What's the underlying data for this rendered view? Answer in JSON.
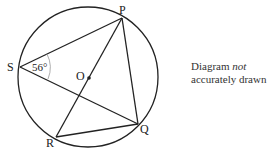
{
  "diagram": {
    "circle": {
      "cx": 88,
      "cy": 77,
      "r": 70
    },
    "points": {
      "P": {
        "x": 122,
        "y": 18,
        "label": "P"
      },
      "S": {
        "x": 20,
        "y": 67,
        "label": "S"
      },
      "Q": {
        "x": 138,
        "y": 124,
        "label": "Q"
      },
      "R": {
        "x": 56,
        "y": 137,
        "label": "R"
      },
      "O": {
        "x": 89,
        "y": 78,
        "label": "O"
      }
    },
    "angle_label": "56°",
    "segments": [
      "SP",
      "SQ",
      "PQ",
      "PR",
      "RQ"
    ]
  },
  "note": {
    "line1_prefix": "Diagram ",
    "line1_emph": "not",
    "line2": "accurately drawn"
  }
}
